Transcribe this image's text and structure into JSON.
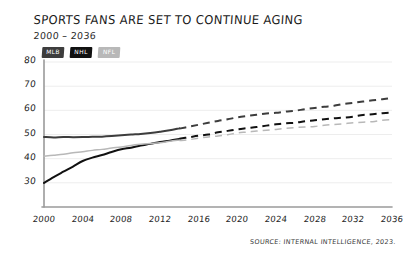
{
  "header": {
    "title": "SPORTS FANS ARE SET TO CONTINUE AGING",
    "subtitle": "2000 – 2036"
  },
  "legend": [
    {
      "label": "MLB",
      "color": "#3d3d3d"
    },
    {
      "label": "NHL",
      "color": "#111111"
    },
    {
      "label": "NFL",
      "color": "#b8b8b8"
    }
  ],
  "footer": {
    "source": "SOURCE: INTERNAL INTELLIGENCE, 2023."
  },
  "chart_data": {
    "type": "line",
    "title": "SPORTS FANS ARE SET TO CONTINUE AGING",
    "subtitle": "2000 – 2036",
    "xlabel": "",
    "ylabel": "",
    "xlim": [
      2000,
      2036
    ],
    "ylim": [
      20,
      80
    ],
    "grid": true,
    "legend_position": "top-left",
    "forecast_start": 2014,
    "x": [
      2000,
      2004,
      2008,
      2012,
      2016,
      2020,
      2024,
      2028,
      2032,
      2036
    ],
    "xticklabels": [
      "2000",
      "2004",
      "2008",
      "2012",
      "2016",
      "2020",
      "2024",
      "2028",
      "2032",
      "2036"
    ],
    "yticks": [
      30,
      40,
      50,
      60,
      70,
      80
    ],
    "yticklabels": [
      "30",
      "40",
      "50",
      "60",
      "70",
      "80"
    ],
    "series": [
      {
        "name": "MLB",
        "color": "#3d3d3d",
        "values": [
          49,
          49,
          49.5,
          51,
          54,
          57,
          59,
          61,
          63,
          65
        ]
      },
      {
        "name": "NFL",
        "color": "#111111",
        "values": [
          30,
          39,
          44,
          47,
          49.5,
          52,
          54,
          56,
          57.5,
          59
        ]
      },
      {
        "name": "NHL",
        "color": "#b8b8b8",
        "values": [
          41,
          43,
          45,
          46.5,
          48.5,
          50.5,
          52,
          53.5,
          55,
          56
        ]
      }
    ]
  }
}
